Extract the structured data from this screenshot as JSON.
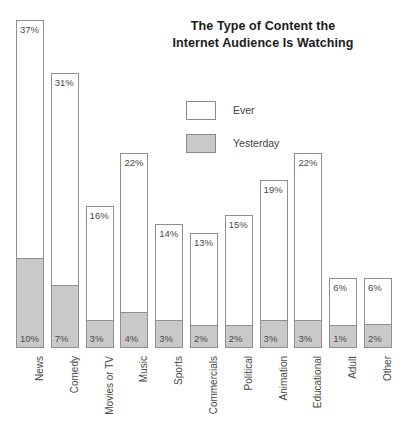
{
  "title": {
    "line1": "The Type of Content the",
    "line2": "Internet Audience Is Watching"
  },
  "legend": {
    "items": [
      {
        "label": "Ever",
        "color": "#ffffff",
        "key": "ever"
      },
      {
        "label": "Yesterday",
        "color": "#c9c9c9",
        "key": "yesterday"
      }
    ]
  },
  "colors": {
    "ever_fill": "#ffffff",
    "yesterday_fill": "#c9c9c9",
    "bar_stroke": "#8f8f8f",
    "text": "#4a4a4a",
    "title_text": "#1a1a1a",
    "background": "#ffffff"
  },
  "chart_data": {
    "type": "bar",
    "title": "The Type of Content the Internet Audience Is Watching",
    "subtitle": "",
    "xlabel": "",
    "ylabel": "",
    "ylim": [
      0,
      37
    ],
    "grid": false,
    "stacked": true,
    "legend_position": "center",
    "value_suffix": "%",
    "categories": [
      "News",
      "Comedy",
      "Movies or TV",
      "Music",
      "Sports",
      "Commercials",
      "Political",
      "Animation",
      "Educational",
      "Adult",
      "Other"
    ],
    "series": [
      {
        "name": "Ever",
        "values": [
          37,
          31,
          16,
          22,
          14,
          13,
          15,
          19,
          22,
          6,
          6
        ],
        "labels": [
          "37%",
          "31%",
          "16%",
          "22%",
          "14%",
          "13%",
          "15%",
          "19%",
          "22%",
          "6%",
          "6%"
        ]
      },
      {
        "name": "Yesterday",
        "values": [
          10,
          7,
          3,
          4,
          3,
          2,
          2,
          3,
          3,
          1,
          2
        ],
        "labels": [
          "10%",
          "7%",
          "3%",
          "4%",
          "3%",
          "2%",
          "2%",
          "3%",
          "3%",
          "1%",
          "2%"
        ]
      }
    ]
  },
  "geometry": {
    "baseline_y": 348,
    "px_per_unit": 8.86,
    "bar_width": 28,
    "bar_step": 34.8,
    "first_bar_left": 16,
    "min_bar_height": 70
  }
}
